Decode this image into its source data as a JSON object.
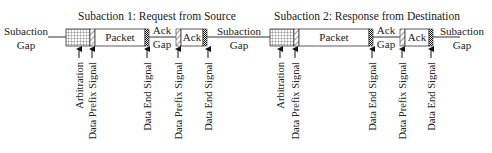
{
  "subactions": [
    {
      "title": "Subaction 1: Request from Source",
      "packet_label": "Packet",
      "ack_gap_label": [
        "Ack",
        "Gap"
      ],
      "ack_label": "Ack",
      "signals": [
        "Arbitration",
        "Data Prefix Signal",
        "Data End Signal",
        "Data Prefix Signal",
        "Data End Signal"
      ]
    },
    {
      "title": "Subaction 2: Response from Destination",
      "packet_label": "Packet",
      "ack_gap_label": [
        "Ack",
        "Gap"
      ],
      "ack_label": "Ack",
      "signals": [
        "Arbitration",
        "Data Prefix Signal",
        "Data End Signal",
        "Data Prefix Signal",
        "Data End Signal"
      ]
    }
  ],
  "gaps": [
    {
      "line1": "Subaction",
      "line2": "Gap"
    },
    {
      "line1": "Subaction",
      "line2": "Gap"
    },
    {
      "line1": "Subaction",
      "line2": "Gap"
    }
  ],
  "legend_patterns": {
    "arbitration": "grid",
    "data_prefix": "diagonal-hatch",
    "data_end": "dense-checker"
  }
}
